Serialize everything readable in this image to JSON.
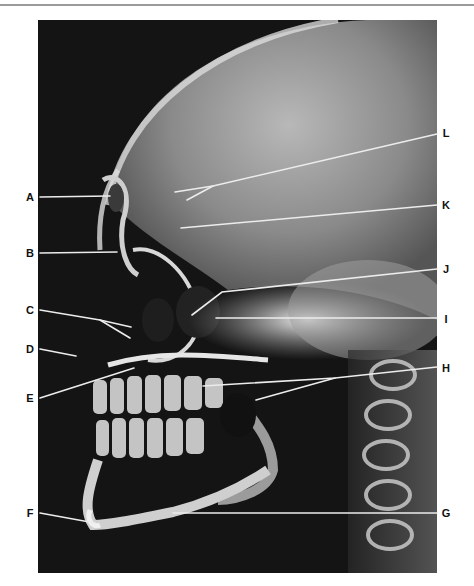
{
  "figure": {
    "background_color": "#141414",
    "leader_color": "#e8e8e8"
  },
  "labels": {
    "left": [
      {
        "id": "A",
        "text": "A",
        "x": 30,
        "y": 197,
        "target": [
          110,
          196
        ]
      },
      {
        "id": "B",
        "text": "B",
        "x": 30,
        "y": 253,
        "target": [
          117,
          252
        ]
      },
      {
        "id": "C",
        "text": "C",
        "x": 30,
        "y": 310,
        "targets": [
          [
            131,
            327
          ],
          [
            130,
            338
          ]
        ]
      },
      {
        "id": "D",
        "text": "D",
        "x": 30,
        "y": 349,
        "target": [
          76,
          356
        ]
      },
      {
        "id": "E",
        "text": "E",
        "x": 30,
        "y": 398,
        "target": [
          134,
          368
        ]
      },
      {
        "id": "F",
        "text": "F",
        "x": 30,
        "y": 513,
        "target": [
          95,
          523
        ]
      }
    ],
    "right": [
      {
        "id": "L",
        "text": "L",
        "x": 445,
        "y": 133,
        "targets": [
          [
            175,
            192
          ],
          [
            187,
            200
          ]
        ]
      },
      {
        "id": "K",
        "text": "K",
        "x": 445,
        "y": 205,
        "target": [
          181,
          228
        ]
      },
      {
        "id": "J",
        "text": "J",
        "x": 445,
        "y": 269,
        "target": [
          192,
          315
        ]
      },
      {
        "id": "I",
        "text": "I",
        "x": 445,
        "y": 319,
        "target": [
          216,
          318
        ]
      },
      {
        "id": "H",
        "text": "H",
        "x": 445,
        "y": 368,
        "targets": [
          [
            203,
            386
          ],
          [
            256,
            400
          ]
        ]
      },
      {
        "id": "G",
        "text": "G",
        "x": 445,
        "y": 513,
        "target": [
          173,
          513
        ]
      }
    ]
  }
}
